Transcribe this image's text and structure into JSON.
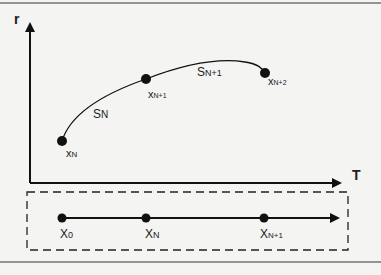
{
  "diagram": {
    "axes": {
      "y_label": "r",
      "x_label": "T"
    },
    "curve_points": [
      {
        "name": "x_N",
        "base": "x",
        "sub": "N",
        "cx": 62,
        "cy": 141
      },
      {
        "name": "x_N+1",
        "base": "x",
        "sub": "N+1",
        "cx": 146,
        "cy": 79
      },
      {
        "name": "x_N+2",
        "base": "x",
        "sub": "N+2",
        "cx": 265,
        "cy": 73
      }
    ],
    "segments": [
      {
        "base": "S",
        "sub": "N"
      },
      {
        "base": "S",
        "sub": "N+1"
      }
    ],
    "timeline_points": [
      {
        "base": "X",
        "sub": "0"
      },
      {
        "base": "X",
        "sub": "N"
      },
      {
        "base": "X",
        "sub": "N+1"
      }
    ],
    "colors": {
      "stroke": "#111111",
      "background": "#f4f4f2",
      "label": "#222222"
    }
  }
}
